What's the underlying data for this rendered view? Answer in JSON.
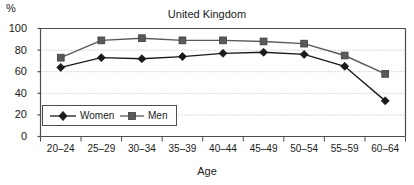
{
  "chart_data": {
    "type": "line",
    "title": "United Kingdom",
    "xlabel": "Age",
    "ylabel": "%",
    "ylim": [
      0,
      100
    ],
    "yticks": [
      "0",
      "20",
      "40",
      "60",
      "80",
      "100"
    ],
    "grid": true,
    "legend_position": "inside-lower-left",
    "categories": [
      "20–24",
      "25–29",
      "30–34",
      "35–39",
      "40–44",
      "45–49",
      "50–54",
      "55–59",
      "60–64"
    ],
    "series": [
      {
        "name": "Women",
        "marker": "diamond",
        "color": "#1a1a1a",
        "values": [
          64,
          73,
          72,
          74,
          77,
          78,
          76,
          65,
          33
        ]
      },
      {
        "name": "Men",
        "marker": "square",
        "color": "#5a5a5a",
        "values": [
          73,
          89,
          91,
          89,
          89,
          88,
          86,
          75,
          58
        ]
      }
    ]
  },
  "legend": {
    "items": [
      {
        "label": "Women",
        "marker": "diamond-marker"
      },
      {
        "label": "Men",
        "marker": "square-marker"
      }
    ]
  },
  "colors": {
    "axis": "#4d4d4d",
    "grid": "#b3b3b3",
    "women_line": "#1a1a1a",
    "men_line": "#5a5a5a",
    "background": "#ffffff"
  }
}
